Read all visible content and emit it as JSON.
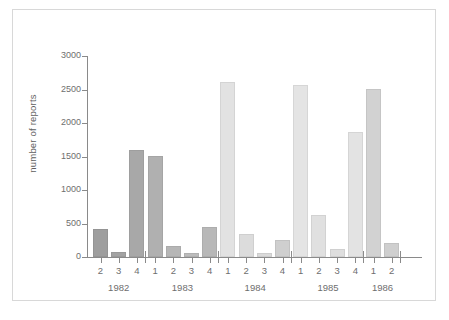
{
  "chart_data": {
    "type": "bar",
    "title": "",
    "xlabel": "",
    "ylabel": "number of reports",
    "ylim": [
      0,
      3000
    ],
    "yticks": [
      0,
      500,
      1000,
      1500,
      2000,
      2500,
      3000
    ],
    "ytick_labels": [
      "0",
      "500",
      "1000",
      "1500",
      "2000",
      "2500",
      "3000"
    ],
    "grid": false,
    "legend": "none",
    "categories": [
      "1982 Q2",
      "1982 Q3",
      "1982 Q4",
      "1983 Q1",
      "1983 Q2",
      "1983 Q3",
      "1983 Q4",
      "1984 Q1",
      "1984 Q2",
      "1984 Q3",
      "1984 Q4",
      "1985 Q1",
      "1985 Q2",
      "1985 Q3",
      "1985 Q4",
      "1986 Q1",
      "1986 Q2"
    ],
    "quarter_labels": [
      "2",
      "3",
      "4",
      "1",
      "2",
      "3",
      "4",
      "1",
      "2",
      "3",
      "4",
      "1",
      "2",
      "3",
      "4",
      "1",
      "2"
    ],
    "values": [
      420,
      75,
      1600,
      1505,
      170,
      55,
      455,
      2610,
      345,
      55,
      255,
      2570,
      620,
      120,
      1870,
      2505,
      205
    ],
    "year_groups": [
      {
        "year": "1982",
        "count": 3
      },
      {
        "year": "1983",
        "count": 4
      },
      {
        "year": "1984",
        "count": 4
      },
      {
        "year": "1985",
        "count": 4
      },
      {
        "year": "1986",
        "count": 2
      }
    ],
    "bar_colors": [
      "#9e9e9e",
      "#a3a3a3",
      "#a8a8a8",
      "#b0b0b0",
      "#b6b6b6",
      "#bcbcbc",
      "#b8b8b8",
      "#e2e2e2",
      "#dcdcdc",
      "#dadada",
      "#cfcfcf",
      "#e4e4e4",
      "#e0e0e0",
      "#dedede",
      "#e3e3e3",
      "#d2d2d2",
      "#cfcfcf"
    ],
    "axis_color": "#8a8a8a",
    "text_color": "#6e6e6e",
    "frame_color": "#d8d8d8",
    "background": "#ffffff"
  }
}
